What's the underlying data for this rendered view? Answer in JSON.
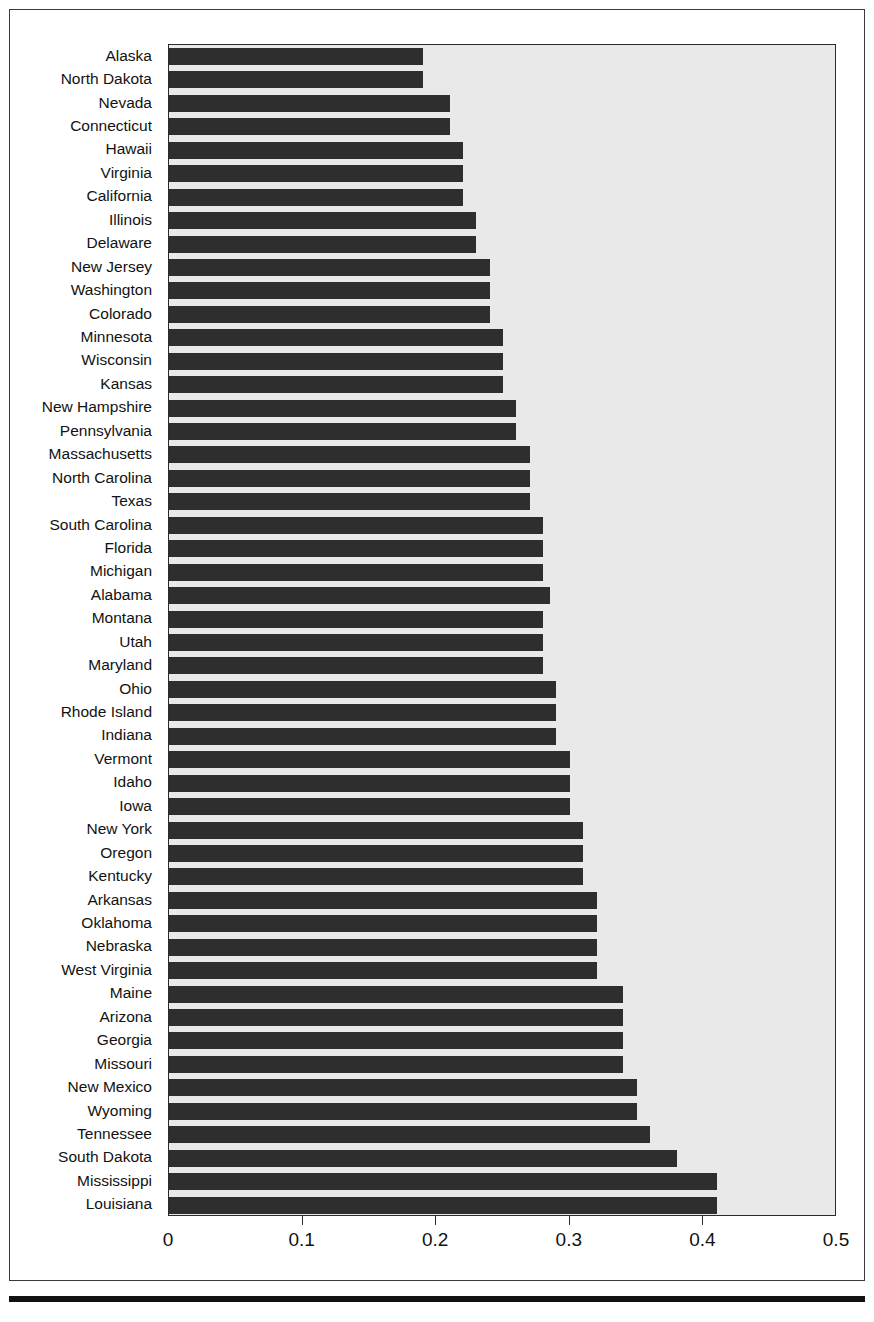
{
  "chart_data": {
    "type": "bar",
    "orientation": "horizontal",
    "title": "",
    "subtitle": "",
    "xlabel": "",
    "ylabel": "",
    "xlim": [
      0,
      0.5
    ],
    "xticks": [
      "0",
      "0.1",
      "0.2",
      "0.3",
      "0.4",
      "0.5"
    ],
    "xtick_values": [
      0,
      0.1,
      0.2,
      0.3,
      0.4,
      0.5
    ],
    "grid": false,
    "legend": null,
    "bar_color": "#2e2e2e",
    "panel_color": "#e9e9e9",
    "categories": [
      "Alaska",
      "North Dakota",
      "Nevada",
      "Connecticut",
      "Hawaii",
      "Virginia",
      "California",
      "Illinois",
      "Delaware",
      "New Jersey",
      "Washington",
      "Colorado",
      "Minnesota",
      "Wisconsin",
      "Kansas",
      "New Hampshire",
      "Pennsylvania",
      "Massachusetts",
      "North Carolina",
      "Texas",
      "South Carolina",
      "Florida",
      "Michigan",
      "Alabama",
      "Montana",
      "Utah",
      "Maryland",
      "Ohio",
      "Rhode Island",
      "Indiana",
      "Vermont",
      "Idaho",
      "Iowa",
      "New York",
      "Oregon",
      "Kentucky",
      "Arkansas",
      "Oklahoma",
      "Nebraska",
      "West Virginia",
      "Maine",
      "Arizona",
      "Georgia",
      "Missouri",
      "New Mexico",
      "Wyoming",
      "Tennessee",
      "South Dakota",
      "Mississippi",
      "Louisiana"
    ],
    "values": [
      0.19,
      0.19,
      0.21,
      0.21,
      0.22,
      0.22,
      0.22,
      0.23,
      0.23,
      0.24,
      0.24,
      0.24,
      0.25,
      0.25,
      0.25,
      0.26,
      0.26,
      0.27,
      0.27,
      0.27,
      0.28,
      0.28,
      0.28,
      0.285,
      0.28,
      0.28,
      0.28,
      0.29,
      0.29,
      0.29,
      0.3,
      0.3,
      0.3,
      0.31,
      0.31,
      0.31,
      0.32,
      0.32,
      0.32,
      0.32,
      0.34,
      0.34,
      0.34,
      0.34,
      0.35,
      0.35,
      0.36,
      0.38,
      0.41,
      0.41
    ]
  }
}
